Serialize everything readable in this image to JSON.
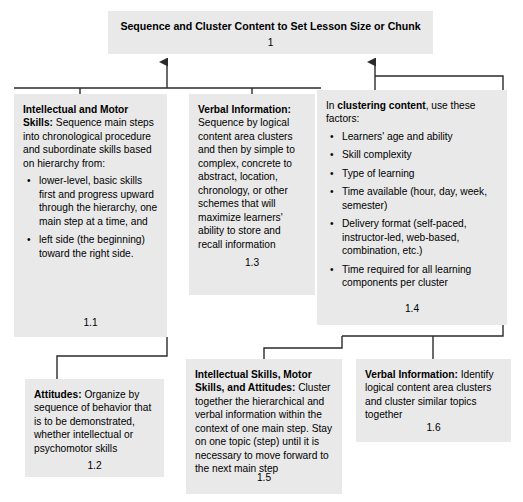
{
  "diagram": {
    "type": "flowchart",
    "title_node": {
      "id": "1",
      "label": "Sequence and Cluster Content to Set Lesson Size or Chunk",
      "ref": "1"
    },
    "nodes": [
      {
        "id": "1.1",
        "ref": "1.1",
        "lead": "Intellectual and Motor Skills:",
        "text": " Sequence main steps into chronological procedure and subordinate skills based on hierarchy from:",
        "bullets": [
          "lower-level, basic skills first and progress upward through the hierarchy, one main step at a time, and",
          "left side (the beginning) toward the right side."
        ]
      },
      {
        "id": "1.3",
        "ref": "1.3",
        "lead": "Verbal Information:",
        "text": " Sequence by logical content area clusters and then by simple to complex, concrete to abstract, location, chronology, or other schemes that will maximize learners' ability to store and recall information",
        "bullets": []
      },
      {
        "id": "1.4",
        "ref": "1.4",
        "lead_inline_pre": "In ",
        "lead": "clustering content",
        "text": ", use these factors:",
        "bullets": [
          "Learners' age and ability",
          "Skill complexity",
          "Type of learning",
          "Time available (hour, day, week, semester)",
          "Delivery format (self-paced, instructor-led, web-based, combination, etc.)",
          "Time required for all learning components per cluster"
        ]
      },
      {
        "id": "1.2",
        "ref": "1.2",
        "lead": "Attitudes:",
        "text": " Organize by sequence of behavior that is to be demonstrated, whether intellectual or psychomotor skills",
        "bullets": []
      },
      {
        "id": "1.5",
        "ref": "1.5",
        "lead": "Intellectual Skills, Motor Skills, and Attitudes:",
        "text": " Cluster together the hierarchical and verbal information within the context of one main step. Stay on one topic (step) until it is necessary to move forward to the next main step",
        "bullets": []
      },
      {
        "id": "1.6",
        "ref": "1.6",
        "lead": "Verbal Information:",
        "text": " Identify logical content area clusters and cluster similar topics together",
        "bullets": []
      }
    ],
    "colors": {
      "node_fill": "#e9e9e9",
      "connector": "#333333",
      "text": "#000000",
      "background": "#ffffff"
    }
  }
}
